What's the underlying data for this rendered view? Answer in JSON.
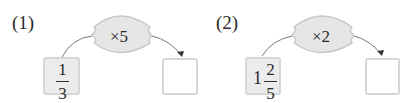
{
  "problems": [
    {
      "label": "(1)",
      "operator": "×5",
      "given": {
        "whole": "",
        "numerator": "1",
        "denominator": "3"
      },
      "answer": ""
    },
    {
      "label": "(2)",
      "operator": "×2",
      "given": {
        "whole": "1",
        "numerator": "2",
        "denominator": "5"
      },
      "answer": ""
    }
  ],
  "colors": {
    "bubble_fill": "#e6e6e6",
    "bubble_stroke": "#c9c9c9",
    "box_fill": "#ececec",
    "box_border": "#d6d6d6"
  }
}
